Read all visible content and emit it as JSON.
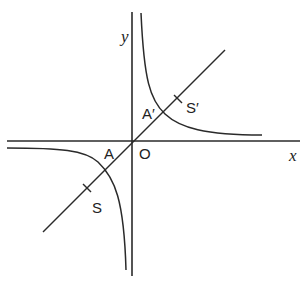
{
  "diagram": {
    "type": "rectangular hyperbola with line through origin",
    "axes": {
      "x_label": "x",
      "y_label": "y"
    },
    "origin_label": "O",
    "points": [
      {
        "id": "A",
        "label": "A",
        "description": "intersection of line with lower-left branch"
      },
      {
        "id": "A_prime",
        "label": "A′",
        "description": "intersection of line with upper-right branch"
      },
      {
        "id": "S",
        "label": "S",
        "description": "focus on line, lower-left"
      },
      {
        "id": "S_prime",
        "label": "S′",
        "description": "focus on line, upper-right"
      }
    ],
    "colors": {
      "stroke": "#2a2a2a",
      "background": "#ffffff"
    }
  }
}
